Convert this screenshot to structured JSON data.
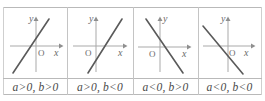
{
  "figure": {
    "type": "four-panel-line-graph-table",
    "axis_labels": {
      "x": "x",
      "y": "y",
      "origin": "O"
    },
    "colors": {
      "line": "#5a5a5a",
      "axis": "#a9a9a9",
      "border": "#b9b9b9",
      "text": "#4a4a4a",
      "background": "#ffffff"
    },
    "columns": [
      {
        "id": "case-1",
        "label": "a>0, b>0",
        "a_sign": "positive",
        "b_sign": "positive",
        "slope": "positive",
        "y_intercept": "positive",
        "x_intercept_side": "left-of-origin",
        "axis_labels": {
          "x": "x",
          "y": "y",
          "origin": "O"
        }
      },
      {
        "id": "case-2",
        "label": "a>0, b<0",
        "a_sign": "positive",
        "b_sign": "negative",
        "slope": "positive",
        "y_intercept": "negative",
        "x_intercept_side": "right-of-origin",
        "axis_labels": {
          "x": "x",
          "y": "y",
          "origin": "O"
        }
      },
      {
        "id": "case-3",
        "label": "a<0, b>0",
        "a_sign": "negative",
        "b_sign": "positive",
        "slope": "negative",
        "y_intercept": "positive",
        "x_intercept_side": "right-of-origin",
        "axis_labels": {
          "x": "x",
          "y": "y",
          "origin": "O"
        }
      },
      {
        "id": "case-4",
        "label": "a<0, b<0",
        "a_sign": "negative",
        "b_sign": "negative",
        "slope": "negative",
        "y_intercept": "negative",
        "x_intercept_side": "left-of-origin",
        "axis_labels": {
          "x": "x",
          "y": "y",
          "origin": "O"
        }
      }
    ]
  }
}
